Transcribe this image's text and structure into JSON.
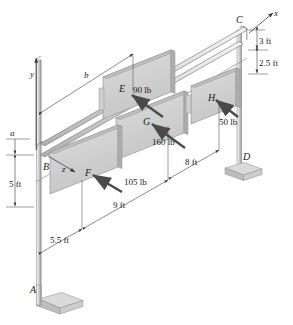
{
  "figure": {
    "background_color": "#ffffff",
    "line_color": "#3c3c3c",
    "panel_face_color": "#d4d4d4",
    "panel_top_color": "#bdbdbd",
    "panel_side_color": "#a9a9a9",
    "pole_color": "#cfcfcf",
    "base_color": "#c8c8c8",
    "arrow_color": "#4a4a4a"
  },
  "points": {
    "A": "A",
    "B": "B",
    "C": "C",
    "D": "D",
    "E": "E",
    "F": "F",
    "G": "G",
    "H": "H"
  },
  "axes": {
    "x": "x",
    "y": "y",
    "z": "z"
  },
  "loads": [
    {
      "point": "E",
      "label": "90 lb",
      "value": 90,
      "unit": "lb"
    },
    {
      "point": "F",
      "label": "105 lb",
      "value": 105,
      "unit": "lb"
    },
    {
      "point": "G",
      "label": "160 lb",
      "value": 160,
      "unit": "lb"
    },
    {
      "point": "H",
      "label": "50 lb",
      "value": 50,
      "unit": "lb"
    }
  ],
  "dimensions": [
    {
      "name": "b",
      "label": "b",
      "kind": "variable"
    },
    {
      "name": "a",
      "label": "a",
      "kind": "variable"
    },
    {
      "name": "top1",
      "label": "3 ft",
      "value": 3,
      "unit": "ft"
    },
    {
      "name": "top2",
      "label": "2.5 ft",
      "value": 2.5,
      "unit": "ft"
    },
    {
      "name": "left",
      "label": "5 ft",
      "value": 5,
      "unit": "ft"
    },
    {
      "name": "front1",
      "label": "5.5 ft",
      "value": 5.5,
      "unit": "ft"
    },
    {
      "name": "front2",
      "label": "9 ft",
      "value": 9,
      "unit": "ft"
    },
    {
      "name": "right",
      "label": "8 ft",
      "value": 8,
      "unit": "ft"
    }
  ]
}
